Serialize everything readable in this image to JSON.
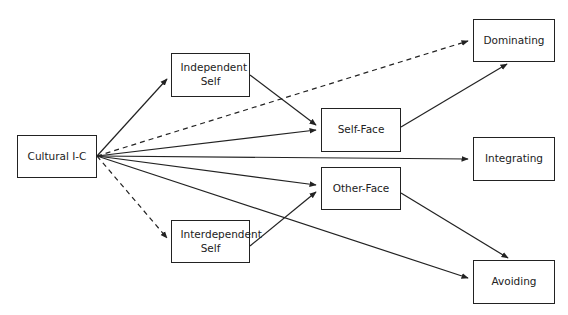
{
  "diagram": {
    "nodes": [
      {
        "id": "cultural",
        "label": "Cultural I-C",
        "x": 17,
        "y": 135,
        "w": 80,
        "h": 43
      },
      {
        "id": "independent",
        "label": "Independent Self",
        "x": 171,
        "y": 53,
        "w": 79,
        "h": 44
      },
      {
        "id": "interdependent",
        "label": "Interdependent Self",
        "x": 171,
        "y": 220,
        "w": 79,
        "h": 43
      },
      {
        "id": "selfface",
        "label": "Self-Face",
        "x": 321,
        "y": 108,
        "w": 80,
        "h": 44
      },
      {
        "id": "otherface",
        "label": "Other-Face",
        "x": 321,
        "y": 167,
        "w": 80,
        "h": 43
      },
      {
        "id": "dominating",
        "label": "Dominating",
        "x": 473,
        "y": 19,
        "w": 82,
        "h": 43
      },
      {
        "id": "integrating",
        "label": "Integrating",
        "x": 473,
        "y": 137,
        "w": 82,
        "h": 44
      },
      {
        "id": "avoiding",
        "label": "Avoiding",
        "x": 473,
        "y": 260,
        "w": 82,
        "h": 44
      }
    ],
    "edges": [
      {
        "from": "cultural",
        "to": "independent",
        "style": "solid"
      },
      {
        "from": "cultural",
        "to": "dominating",
        "style": "dashed"
      },
      {
        "from": "cultural",
        "to": "selfface",
        "style": "solid"
      },
      {
        "from": "cultural",
        "to": "integrating",
        "style": "solid"
      },
      {
        "from": "cultural",
        "to": "otherface",
        "style": "solid"
      },
      {
        "from": "cultural",
        "to": "avoiding",
        "style": "solid"
      },
      {
        "from": "cultural",
        "to": "interdependent",
        "style": "dashed"
      },
      {
        "from": "independent",
        "to": "selfface",
        "style": "solid"
      },
      {
        "from": "interdependent",
        "to": "otherface",
        "style": "solid"
      },
      {
        "from": "selfface",
        "to": "dominating",
        "style": "solid"
      },
      {
        "from": "otherface",
        "to": "avoiding",
        "style": "solid"
      }
    ]
  }
}
